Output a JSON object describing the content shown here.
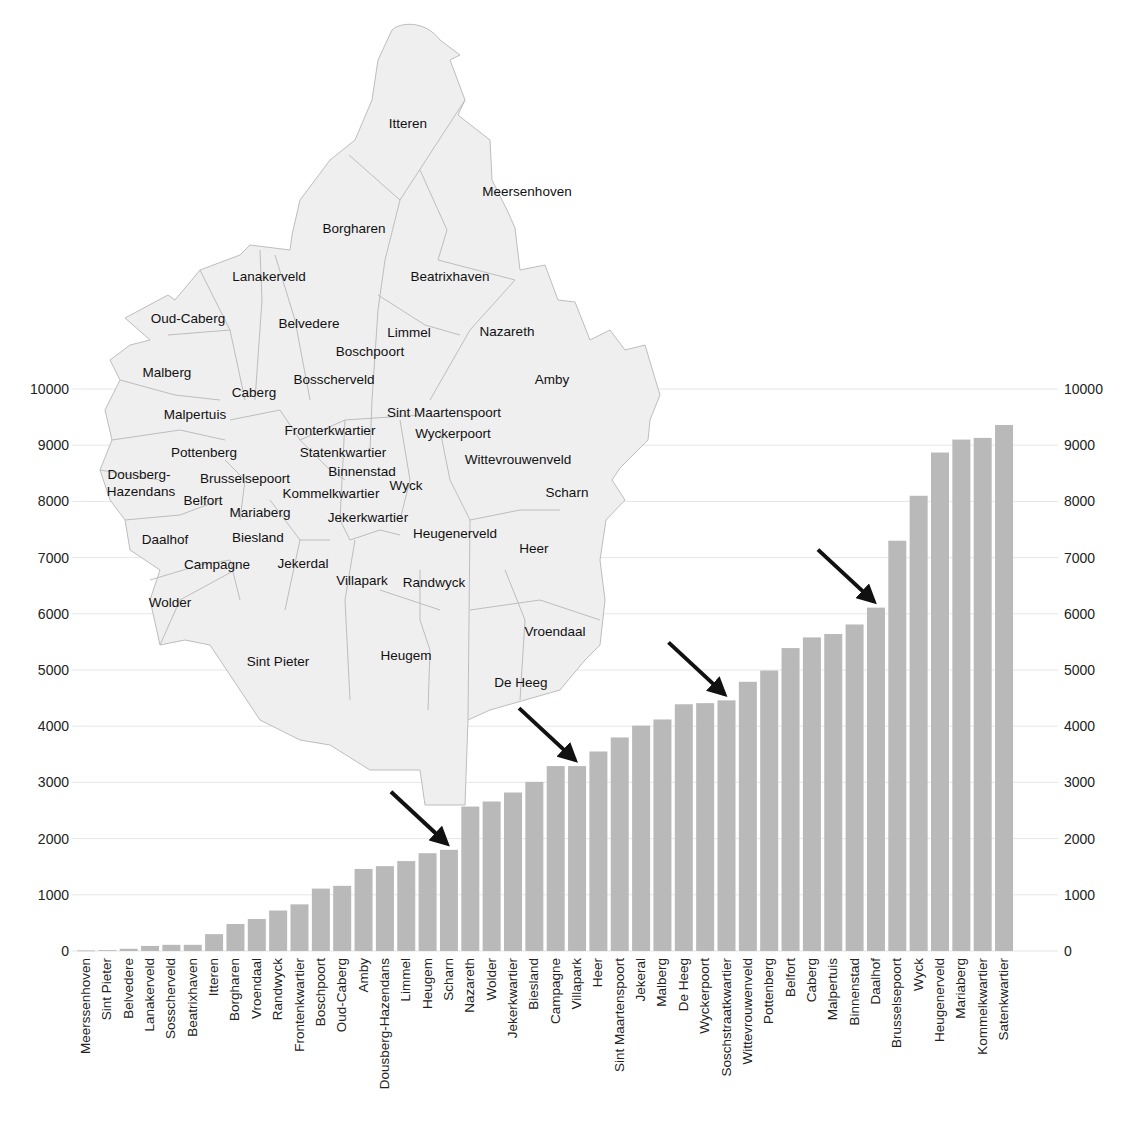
{
  "chart_data": {
    "type": "bar",
    "title": "",
    "xlabel": "",
    "ylabel": "",
    "ylim": [
      0,
      10000
    ],
    "yticks": [
      0,
      1000,
      2000,
      3000,
      4000,
      5000,
      6000,
      7000,
      8000,
      9000,
      10000
    ],
    "grid": true,
    "axes": "left and right y-axis tick labels",
    "bar_color": "#b9b9b9",
    "categories": [
      "Meerssenhoven",
      "Sint Pieter",
      "Belvedere",
      "Lanakerveld",
      "Sosscherveld",
      "Beatrixhaven",
      "Itteren",
      "Borgharen",
      "Vroendaal",
      "Randwyck",
      "Frontenkwartier",
      "Boschpoort",
      "Oud-Caberg",
      "Amby",
      "Dousberg-Hazendans",
      "Limmel",
      "Heugem",
      "Scharn",
      "Nazareth",
      "Wolder",
      "Jekerkwartier",
      "Biesland",
      "Campagne",
      "Villapark",
      "Heer",
      "Sint Maartenspoort",
      "Jekeral",
      "Malberg",
      "De Heeg",
      "Wyckerpoort",
      "Soschstraatkwartier",
      "Wittevrouwenveld",
      "Pottenberg",
      "Belfort",
      "Caberg",
      "Malpertuis",
      "Binnenstad",
      "Daalhof",
      "Brusselsepoort",
      "Wyck",
      "Heugenerveld",
      "Mariaberg",
      "Kommelkwartier",
      "Satenkwartier"
    ],
    "values": [
      10,
      15,
      40,
      90,
      110,
      110,
      300,
      480,
      570,
      720,
      830,
      1110,
      1160,
      1460,
      1510,
      1600,
      1740,
      1800,
      2570,
      2660,
      2820,
      3010,
      3290,
      3290,
      3550,
      3800,
      4010,
      4120,
      4390,
      4410,
      4460,
      4790,
      4990,
      5390,
      5580,
      5640,
      5810,
      6110,
      7300,
      8100,
      8870,
      9100,
      9130,
      9360
    ],
    "annotations": [
      {
        "type": "arrow",
        "points_to": "Scharn"
      },
      {
        "type": "arrow",
        "points_to": "Villapark"
      },
      {
        "type": "arrow",
        "points_to": "Soschstraatkwartier"
      },
      {
        "type": "arrow",
        "points_to": "Daalhof"
      }
    ]
  },
  "map": {
    "fill": "#efefef",
    "stroke": "#bdbdbd",
    "labels": [
      {
        "text": "Itteren",
        "x": 408,
        "y": 128
      },
      {
        "text": "Meersenhoven",
        "x": 527,
        "y": 196
      },
      {
        "text": "Borgharen",
        "x": 354,
        "y": 233
      },
      {
        "text": "Lanakerveld",
        "x": 269,
        "y": 281
      },
      {
        "text": "Beatrixhaven",
        "x": 450,
        "y": 281
      },
      {
        "text": "Oud-Caberg",
        "x": 188,
        "y": 323
      },
      {
        "text": "Belvedere",
        "x": 309,
        "y": 328
      },
      {
        "text": "Limmel",
        "x": 409,
        "y": 337
      },
      {
        "text": "Nazareth",
        "x": 507,
        "y": 336
      },
      {
        "text": "Boschpoort",
        "x": 370,
        "y": 356
      },
      {
        "text": "Malberg",
        "x": 167,
        "y": 377
      },
      {
        "text": "Bosscherveld",
        "x": 334,
        "y": 384
      },
      {
        "text": "Amby",
        "x": 552,
        "y": 384
      },
      {
        "text": "Caberg",
        "x": 254,
        "y": 397
      },
      {
        "text": "Malpertuis",
        "x": 195,
        "y": 419
      },
      {
        "text": "Sint Maartenspoort",
        "x": 444,
        "y": 417
      },
      {
        "text": "Fronterkwartier",
        "x": 330,
        "y": 435
      },
      {
        "text": "Wyckerpoort",
        "x": 453,
        "y": 438
      },
      {
        "text": "Pottenberg",
        "x": 204,
        "y": 457
      },
      {
        "text": "Statenkwartier",
        "x": 343,
        "y": 457
      },
      {
        "text": "Wittevrouwenveld",
        "x": 518,
        "y": 464
      },
      {
        "text": "Binnenstad",
        "x": 362,
        "y": 476
      },
      {
        "text": "Dousberg-",
        "x": 139,
        "y": 479
      },
      {
        "text": "Brusselsepoort",
        "x": 245,
        "y": 483
      },
      {
        "text": "Wyck",
        "x": 406,
        "y": 490
      },
      {
        "text": "Hazendans",
        "x": 141,
        "y": 496
      },
      {
        "text": "Kommelkwartier",
        "x": 331,
        "y": 498
      },
      {
        "text": "Scharn",
        "x": 567,
        "y": 497
      },
      {
        "text": "Belfort",
        "x": 203,
        "y": 505
      },
      {
        "text": "Mariaberg",
        "x": 260,
        "y": 517
      },
      {
        "text": "Jekerkwartier",
        "x": 368,
        "y": 522
      },
      {
        "text": "Heugenerveld",
        "x": 455,
        "y": 538
      },
      {
        "text": "Daalhof",
        "x": 165,
        "y": 544
      },
      {
        "text": "Biesland",
        "x": 258,
        "y": 542
      },
      {
        "text": "Heer",
        "x": 534,
        "y": 553
      },
      {
        "text": "Campagne",
        "x": 217,
        "y": 569
      },
      {
        "text": "Jekerdal",
        "x": 303,
        "y": 568
      },
      {
        "text": "Villapark",
        "x": 362,
        "y": 585
      },
      {
        "text": "Randwyck",
        "x": 434,
        "y": 587
      },
      {
        "text": "Wolder",
        "x": 170,
        "y": 607
      },
      {
        "text": "Vroendaal",
        "x": 555,
        "y": 636
      },
      {
        "text": "Sint Pieter",
        "x": 278,
        "y": 666
      },
      {
        "text": "Heugem",
        "x": 406,
        "y": 660
      },
      {
        "text": "De Heeg",
        "x": 521,
        "y": 687
      }
    ]
  }
}
